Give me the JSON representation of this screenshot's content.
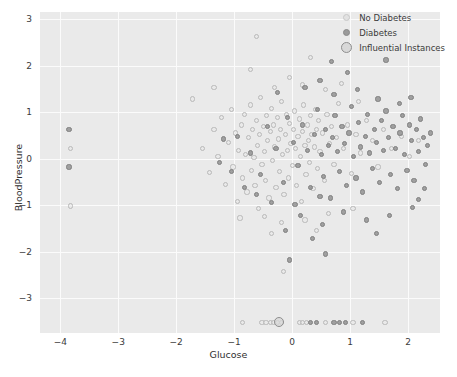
{
  "chart_data": {
    "type": "scatter",
    "title": "",
    "xlabel": "Glucose",
    "ylabel": "BloodPressure",
    "xlim": [
      -4.35,
      2.55
    ],
    "ylim": [
      -3.75,
      3.15
    ],
    "xticks": [
      -4,
      -3,
      -2,
      -1,
      0,
      1,
      2
    ],
    "yticks": [
      3,
      2,
      1,
      0,
      -1,
      -2,
      -3
    ],
    "xticklabels": [
      "−4",
      "−3",
      "−2",
      "−1",
      "0",
      "1",
      "2"
    ],
    "yticklabels": [
      "3",
      "2",
      "1",
      "0",
      "−1",
      "−2",
      "−3"
    ],
    "grid": true,
    "grid_color": "#fbfbfb",
    "plot_background": "#eaeaea",
    "legend_position": "upper right",
    "legend": [
      {
        "label": "No Diabetes",
        "marker": "light-open-circle",
        "color": "#c9c9c9"
      },
      {
        "label": "Diabetes",
        "marker": "dark-filled-circle",
        "color": "#8a8a8a"
      },
      {
        "label": "Influential Instances",
        "marker": "large-ringed-circle",
        "color": "#8e8e8e"
      }
    ],
    "series": [
      {
        "name": "No Diabetes",
        "marker_color": "#b9b9b9",
        "marker_size": 5.2,
        "points": [
          [
            -3.82,
            -1.02
          ],
          [
            -1.72,
            1.28
          ],
          [
            -1.55,
            0.22
          ],
          [
            -1.42,
            -0.3
          ],
          [
            -1.35,
            0.62
          ],
          [
            -1.28,
            0.05
          ],
          [
            -1.22,
            0.88
          ],
          [
            -1.15,
            -0.55
          ],
          [
            -1.1,
            0.35
          ],
          [
            -1.05,
            1.05
          ],
          [
            -1.02,
            -0.18
          ],
          [
            -0.98,
            0.55
          ],
          [
            -0.95,
            -0.92
          ],
          [
            -0.92,
            0.18
          ],
          [
            -0.88,
            0.72
          ],
          [
            -0.85,
            -0.42
          ],
          [
            -0.82,
            0.95
          ],
          [
            -0.8,
            0.08
          ],
          [
            -0.78,
            -0.72
          ],
          [
            -0.75,
            0.45
          ],
          [
            -0.72,
            1.15
          ],
          [
            -0.7,
            -0.25
          ],
          [
            -0.68,
            0.62
          ],
          [
            -0.66,
            0.02
          ],
          [
            -0.64,
            -0.58
          ],
          [
            -0.62,
            0.82
          ],
          [
            -0.6,
            0.28
          ],
          [
            -0.58,
            -1.08
          ],
          [
            -0.56,
            0.52
          ],
          [
            -0.54,
            1.32
          ],
          [
            -0.52,
            -0.12
          ],
          [
            -0.5,
            0.68
          ],
          [
            -0.48,
            0.15
          ],
          [
            -0.46,
            -0.48
          ],
          [
            -0.44,
            0.92
          ],
          [
            -0.42,
            0.38
          ],
          [
            -0.4,
            -0.85
          ],
          [
            -0.38,
            0.58
          ],
          [
            -0.36,
            1.08
          ],
          [
            -0.34,
            -0.05
          ],
          [
            -0.32,
            0.72
          ],
          [
            -0.3,
            0.25
          ],
          [
            -0.28,
            -0.62
          ],
          [
            -0.26,
            0.88
          ],
          [
            -0.24,
            0.42
          ],
          [
            -0.22,
            -0.28
          ],
          [
            -0.2,
            0.62
          ],
          [
            -0.18,
            1.22
          ],
          [
            -0.16,
            0.08
          ],
          [
            -0.14,
            -0.78
          ],
          [
            -0.12,
            0.52
          ],
          [
            -0.1,
            0.95
          ],
          [
            -0.08,
            0.18
          ],
          [
            -0.06,
            -0.42
          ],
          [
            -0.04,
            0.75
          ],
          [
            -0.02,
            0.32
          ],
          [
            0.0,
            -0.15
          ],
          [
            0.02,
            0.62
          ],
          [
            0.04,
            1.02
          ],
          [
            0.06,
            0.22
          ],
          [
            0.08,
            -0.58
          ],
          [
            0.1,
            0.48
          ],
          [
            0.12,
            0.85
          ],
          [
            0.14,
            0.05
          ],
          [
            0.16,
            -0.92
          ],
          [
            0.18,
            0.58
          ],
          [
            0.2,
            1.15
          ],
          [
            0.22,
            0.28
          ],
          [
            0.24,
            -0.35
          ],
          [
            0.26,
            0.72
          ],
          [
            0.28,
            0.38
          ],
          [
            0.3,
            -0.08
          ],
          [
            0.32,
            0.92
          ],
          [
            0.34,
            0.52
          ],
          [
            0.36,
            -0.65
          ],
          [
            0.38,
            0.25
          ],
          [
            0.4,
            1.05
          ],
          [
            0.42,
            0.62
          ],
          [
            0.44,
            -0.22
          ],
          [
            0.46,
            0.82
          ],
          [
            0.48,
            0.15
          ],
          [
            0.52,
            0.55
          ],
          [
            0.56,
            -0.48
          ],
          [
            0.6,
            0.95
          ],
          [
            0.64,
            0.32
          ],
          [
            0.68,
            0.68
          ],
          [
            0.72,
            -0.12
          ],
          [
            0.76,
            0.45
          ],
          [
            0.8,
            1.18
          ],
          [
            0.88,
            0.22
          ],
          [
            0.95,
            0.72
          ],
          [
            1.02,
            -0.32
          ],
          [
            1.1,
            0.52
          ],
          [
            1.18,
            0.12
          ],
          [
            1.28,
            0.82
          ],
          [
            1.38,
            0.38
          ],
          [
            1.48,
            -0.18
          ],
          [
            1.58,
            0.62
          ],
          [
            1.72,
            0.22
          ],
          [
            1.88,
            0.48
          ],
          [
            2.02,
            0.05
          ],
          [
            2.18,
            0.38
          ],
          [
            -0.62,
            2.62
          ],
          [
            -1.35,
            1.52
          ],
          [
            -0.3,
            1.52
          ],
          [
            0.18,
            1.58
          ],
          [
            0.58,
            1.48
          ],
          [
            1.15,
            1.22
          ],
          [
            -0.05,
            1.75
          ],
          [
            0.85,
            1.62
          ],
          [
            -0.48,
            -1.25
          ],
          [
            -0.18,
            -1.38
          ],
          [
            0.22,
            -1.32
          ],
          [
            0.62,
            -1.18
          ],
          [
            -0.9,
            -1.28
          ],
          [
            1.05,
            -1.08
          ],
          [
            -0.35,
            -1.62
          ],
          [
            0.42,
            -1.55
          ],
          [
            -0.72,
            1.92
          ],
          [
            0.32,
            2.18
          ],
          [
            -0.15,
            -2.42
          ],
          [
            -0.85,
            -3.52
          ],
          [
            -0.52,
            -3.52
          ],
          [
            -0.45,
            -3.52
          ],
          [
            -0.38,
            -3.52
          ],
          [
            -0.32,
            -3.52
          ],
          [
            -0.25,
            -3.52
          ],
          [
            -0.18,
            -3.52
          ],
          [
            0.12,
            -3.52
          ],
          [
            0.18,
            -3.52
          ],
          [
            0.25,
            -3.52
          ],
          [
            0.58,
            -3.52
          ],
          [
            1.05,
            -3.52
          ],
          [
            1.6,
            -3.52
          ],
          [
            -3.82,
            0.22
          ]
        ]
      },
      {
        "name": "Diabetes",
        "marker_color": "#808080",
        "marker_size": 5.2,
        "points": [
          [
            -3.85,
            0.62
          ],
          [
            -3.85,
            -0.18
          ],
          [
            -0.95,
            0.48
          ],
          [
            -0.72,
            0.12
          ],
          [
            -0.55,
            -0.35
          ],
          [
            -0.42,
            0.68
          ],
          [
            -0.28,
            0.22
          ],
          [
            -0.15,
            -0.52
          ],
          [
            -0.08,
            0.88
          ],
          [
            0.02,
            0.35
          ],
          [
            0.1,
            -0.15
          ],
          [
            0.18,
            0.72
          ],
          [
            0.26,
            0.18
          ],
          [
            0.32,
            -0.62
          ],
          [
            0.38,
            0.52
          ],
          [
            0.44,
            1.05
          ],
          [
            0.5,
            0.08
          ],
          [
            0.54,
            -0.38
          ],
          [
            0.58,
            0.62
          ],
          [
            0.62,
            0.28
          ],
          [
            0.66,
            -0.85
          ],
          [
            0.7,
            0.45
          ],
          [
            0.74,
            0.92
          ],
          [
            0.78,
            0.15
          ],
          [
            0.82,
            -0.28
          ],
          [
            0.86,
            0.68
          ],
          [
            0.9,
            0.32
          ],
          [
            0.94,
            -0.58
          ],
          [
            0.98,
            0.55
          ],
          [
            1.02,
            1.12
          ],
          [
            1.06,
            0.05
          ],
          [
            1.1,
            -0.42
          ],
          [
            1.14,
            0.78
          ],
          [
            1.18,
            0.25
          ],
          [
            1.22,
            -0.72
          ],
          [
            1.26,
            0.48
          ],
          [
            1.3,
            0.95
          ],
          [
            1.34,
            0.12
          ],
          [
            1.38,
            -0.22
          ],
          [
            1.42,
            0.62
          ],
          [
            1.46,
            0.35
          ],
          [
            1.5,
            -0.52
          ],
          [
            1.54,
            0.82
          ],
          [
            1.58,
            0.18
          ],
          [
            1.62,
            1.02
          ],
          [
            1.66,
            0.45
          ],
          [
            1.7,
            -0.35
          ],
          [
            1.74,
            0.68
          ],
          [
            1.78,
            0.22
          ],
          [
            1.82,
            -0.65
          ],
          [
            1.86,
            0.55
          ],
          [
            1.9,
            0.92
          ],
          [
            1.94,
            0.08
          ],
          [
            1.98,
            -0.25
          ],
          [
            2.02,
            0.72
          ],
          [
            2.06,
            0.38
          ],
          [
            2.1,
            -0.48
          ],
          [
            2.14,
            0.62
          ],
          [
            2.18,
            0.15
          ],
          [
            2.22,
            0.85
          ],
          [
            2.26,
            0.45
          ],
          [
            2.3,
            -0.12
          ],
          [
            2.34,
            0.28
          ],
          [
            2.38,
            0.55
          ],
          [
            0.22,
            1.52
          ],
          [
            0.48,
            1.68
          ],
          [
            0.72,
            1.38
          ],
          [
            1.12,
            1.48
          ],
          [
            1.48,
            1.28
          ],
          [
            1.85,
            1.18
          ],
          [
            2.05,
            1.32
          ],
          [
            0.95,
            1.85
          ],
          [
            -0.25,
            1.42
          ],
          [
            1.62,
            2.12
          ],
          [
            0.68,
            2.08
          ],
          [
            0.15,
            -1.22
          ],
          [
            0.52,
            -1.42
          ],
          [
            0.88,
            -1.15
          ],
          [
            1.28,
            -1.32
          ],
          [
            1.68,
            -1.22
          ],
          [
            2.08,
            -1.05
          ],
          [
            -0.12,
            -1.55
          ],
          [
            0.35,
            -1.72
          ],
          [
            -0.05,
            -2.18
          ],
          [
            0.58,
            -2.05
          ],
          [
            1.45,
            -1.62
          ],
          [
            0.32,
            -3.52
          ],
          [
            0.42,
            -3.52
          ],
          [
            0.72,
            -3.52
          ],
          [
            0.82,
            -3.52
          ],
          [
            0.92,
            -3.52
          ],
          [
            1.22,
            -3.52
          ],
          [
            -0.62,
            -0.78
          ],
          [
            -0.35,
            -0.95
          ],
          [
            -0.82,
            -0.62
          ],
          [
            -1.05,
            -0.28
          ],
          [
            -1.18,
            0.42
          ],
          [
            -1.25,
            -0.08
          ],
          [
            0.05,
            -0.98
          ],
          [
            0.48,
            -0.82
          ],
          [
            2.28,
            -0.65
          ],
          [
            2.18,
            -0.88
          ]
        ]
      },
      {
        "name": "Influential Instances",
        "marker_color": "#8e8e8e",
        "marker_size": 10,
        "points": [
          [
            -0.22,
            -3.52
          ]
        ]
      }
    ]
  }
}
